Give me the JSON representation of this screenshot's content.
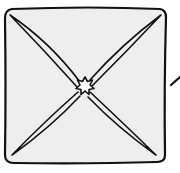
{
  "figure": {
    "colors": {
      "ink": "#111111",
      "fill": "#eeeeee",
      "star_fill": "#ffffff",
      "background": "#ffffff"
    },
    "elements": [
      "outer-square",
      "diagonal-lens-tl-br",
      "diagonal-lens-tr-bl",
      "center-star",
      "side-tick-mark"
    ]
  }
}
